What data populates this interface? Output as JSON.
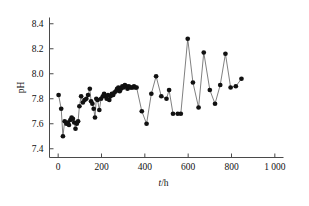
{
  "chart_data": {
    "type": "line",
    "title": "",
    "xlabel": "t/h",
    "ylabel": "pH",
    "xlim": [
      -40,
      1040
    ],
    "ylim": [
      7.33,
      8.45
    ],
    "grid": false,
    "legend": null,
    "marker": "filled-circle",
    "marker_color": "#111111",
    "line_color": "#555555",
    "xticks": [
      0,
      200,
      400,
      600,
      800,
      1000
    ],
    "xtick_labels": [
      "0",
      "200",
      "400",
      "600",
      "800",
      "1 000"
    ],
    "yticks": [
      7.4,
      7.6,
      7.8,
      8.0,
      8.2,
      8.4
    ],
    "ytick_labels": [
      "7.4",
      "7.6",
      "7.8",
      "8.0",
      "8.2",
      "8.4"
    ],
    "series": [
      {
        "name": "pH",
        "x": [
          2,
          14,
          22,
          30,
          38,
          44,
          50,
          56,
          62,
          68,
          74,
          80,
          86,
          92,
          98,
          106,
          114,
          122,
          130,
          138,
          146,
          152,
          158,
          164,
          170,
          176,
          182,
          190,
          198,
          206,
          212,
          218,
          224,
          230,
          236,
          242,
          248,
          254,
          260,
          266,
          272,
          278,
          284,
          290,
          296,
          302,
          308,
          314,
          320,
          326,
          332,
          338,
          344,
          350,
          356,
          362,
          386,
          408,
          430,
          452,
          476,
          500,
          512,
          530,
          552,
          566,
          598,
          622,
          648,
          672,
          700,
          724,
          748,
          772,
          796,
          820,
          846
        ],
        "y": [
          7.83,
          7.72,
          7.5,
          7.62,
          7.6,
          7.61,
          7.59,
          7.63,
          7.65,
          7.64,
          7.61,
          7.56,
          7.6,
          7.62,
          7.74,
          7.82,
          7.77,
          7.79,
          7.8,
          7.83,
          7.88,
          7.78,
          7.76,
          7.72,
          7.65,
          7.8,
          7.79,
          7.71,
          7.8,
          7.82,
          7.84,
          7.82,
          7.8,
          7.83,
          7.79,
          7.82,
          7.84,
          7.83,
          7.85,
          7.86,
          7.88,
          7.89,
          7.86,
          7.88,
          7.9,
          7.89,
          7.91,
          7.9,
          7.88,
          7.9,
          7.89,
          7.89,
          7.89,
          7.9,
          7.89,
          7.89,
          7.7,
          7.6,
          7.84,
          7.98,
          7.82,
          7.8,
          7.87,
          7.68,
          7.68,
          7.68,
          8.28,
          7.93,
          7.73,
          8.17,
          7.87,
          7.76,
          7.91,
          8.16,
          7.89,
          7.9,
          7.96
        ]
      }
    ]
  },
  "axis": {
    "x_label": "t/h",
    "x_label_italic_part": "t",
    "x_label_rest": "/h",
    "y_label": "pH"
  }
}
